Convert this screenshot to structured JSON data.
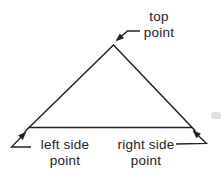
{
  "diagram": {
    "type": "labeled-triangle",
    "background": "#ffffff",
    "line_color": "#222222",
    "text_color": "#1c1c1c",
    "labels": {
      "top": {
        "label": "top point",
        "line1": "top",
        "line2": "point"
      },
      "left": {
        "label": "left side point",
        "line1": "left side",
        "line2": "point"
      },
      "right": {
        "label": "right side point",
        "line1": "right side",
        "line2": "point"
      }
    }
  }
}
